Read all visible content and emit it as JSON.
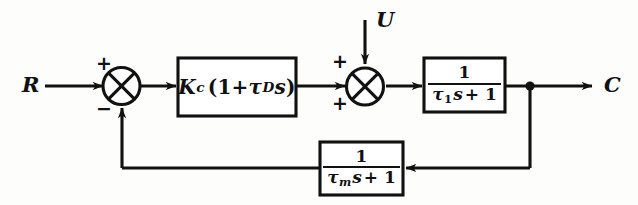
{
  "diagram": {
    "type": "control-block-diagram",
    "stroke_color": "#111111",
    "background_color": "#fdfdfb"
  },
  "signals": {
    "setpoint": "R",
    "disturbance": "U",
    "output": "C"
  },
  "summers": {
    "error_junction": {
      "name": "error-summing-junction",
      "input_sign_reference": "+",
      "input_sign_feedback": "−"
    },
    "load_junction": {
      "name": "load-summing-junction",
      "input_sign_upper": "+",
      "input_sign_lower": "+"
    }
  },
  "blocks": {
    "controller": {
      "name": "controller-block",
      "gain_symbol": "K",
      "gain_subscript": "c",
      "open_paren": "(1+",
      "tau_symbol": "τ",
      "tau_subscript": "D",
      "laplace_var": "s",
      "close_paren": ")",
      "expression": "Kc(1 + τD s)"
    },
    "process": {
      "name": "process-block",
      "numerator": "1",
      "tau_symbol": "τ",
      "tau_subscript": "1",
      "laplace_var": "s",
      "plus_one": "+ 1",
      "expression": "1 / (τ1 s + 1)"
    },
    "measurement": {
      "name": "measurement-block",
      "numerator": "1",
      "tau_symbol": "τ",
      "tau_subscript": "m",
      "laplace_var": "s",
      "plus_one": "+ 1",
      "expression": "1 / (τm s + 1)"
    }
  }
}
